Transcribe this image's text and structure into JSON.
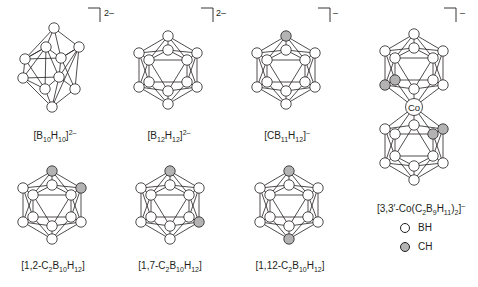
{
  "colors": {
    "line": "#231f20",
    "bh_fill": "#ffffff",
    "ch_fill": "#b3b3b3"
  },
  "structures": [
    {
      "id": "b10h10",
      "label_html": "[B<sub>10</sub>H<sub>10</sub>]<sup>2–</sup>",
      "charge": "2–",
      "label_pos": [
        55,
        130
      ],
      "charge_pos": [
        104,
        8
      ]
    },
    {
      "id": "b12h12",
      "label_html": "[B<sub>12</sub>H<sub>12</sub>]<sup>2–</sup>",
      "charge": "2–",
      "label_pos": [
        169,
        130
      ],
      "charge_pos": [
        216,
        8
      ]
    },
    {
      "id": "cb11h12",
      "label_html": "[CB<sub>11</sub>H<sub>12</sub>]<sup>–</sup>",
      "charge": "–",
      "label_pos": [
        287,
        130
      ],
      "charge_pos": [
        333,
        8
      ]
    },
    {
      "id": "co-c2b9h11",
      "label_html": "[3,3′-Co(C<sub>2</sub>B<sub>9</sub>H<sub>11</sub>)<sub>2</sub>]<sup>–</sup>",
      "charge": "–",
      "label_pos": [
        421,
        203
      ],
      "charge_pos": [
        460,
        8
      ]
    },
    {
      "id": "1-2-c2b10h12",
      "label_html": "[1,2-C<sub>2</sub>B<sub>10</sub>H<sub>12</sub>]",
      "charge": "",
      "label_pos": [
        53,
        260
      ]
    },
    {
      "id": "1-7-c2b10h12",
      "label_html": "[1,7-C<sub>2</sub>B<sub>10</sub>H<sub>12</sub>]",
      "charge": "",
      "label_pos": [
        170,
        260
      ]
    },
    {
      "id": "1-12-c2b10h12",
      "label_html": "[1,12-C<sub>2</sub>B<sub>10</sub>H<sub>12</sub>]",
      "charge": "",
      "label_pos": [
        290,
        260
      ]
    }
  ],
  "cobalt_label": "Co",
  "legend": [
    {
      "label": "BH",
      "fill": "#ffffff"
    },
    {
      "label": "CH",
      "fill": "#b3b3b3"
    }
  ]
}
